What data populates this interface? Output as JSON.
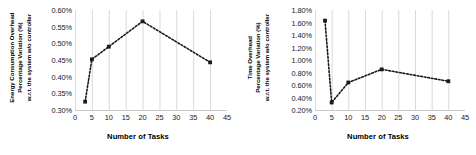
{
  "figure": {
    "panel_count": 2
  },
  "chart_data": [
    {
      "type": "line",
      "panel": "left",
      "title": "",
      "ylabel_lines": [
        "Energy Consumption Overhead",
        "Percentage Variation (%)",
        "w.r.t. the system w/o controller"
      ],
      "xlabel": "Number of Tasks",
      "x": [
        3,
        5,
        10,
        20,
        40
      ],
      "values": [
        0.325,
        0.452,
        0.49,
        0.566,
        0.443
      ],
      "xlim": [
        0,
        45
      ],
      "ylim": [
        0.3,
        0.6
      ],
      "xticks": [
        0,
        5,
        10,
        15,
        20,
        25,
        30,
        35,
        40,
        45
      ],
      "xticklabels": [
        "0",
        "5",
        "10",
        "15",
        "20",
        "25",
        "30",
        "35",
        "40",
        "45"
      ],
      "yticks": [
        0.3,
        0.35,
        0.4,
        0.45,
        0.5,
        0.55,
        0.6
      ],
      "yticklabels": [
        "0.30%",
        "0.35%",
        "0.40%",
        "0.45%",
        "0.50%",
        "0.55%",
        "0.60%"
      ],
      "grid": "vertical",
      "legend": "none",
      "marker": "square",
      "linestyle": "dotted",
      "color": "#1a1a1a"
    },
    {
      "type": "line",
      "panel": "right",
      "title": "",
      "ylabel_lines": [
        "Time Overhead",
        "Percentage Variation (%)",
        "w.r.t. the system w/o controller"
      ],
      "xlabel": "Number of Tasks",
      "x": [
        3,
        5,
        10,
        20,
        40
      ],
      "values": [
        1.63,
        0.32,
        0.64,
        0.85,
        0.66
      ],
      "xlim": [
        0,
        45
      ],
      "ylim": [
        0.2,
        1.8
      ],
      "xticks": [
        0,
        5,
        10,
        15,
        20,
        25,
        30,
        35,
        40,
        45
      ],
      "xticklabels": [
        "0",
        "5",
        "10",
        "15",
        "20",
        "25",
        "30",
        "35",
        "40",
        "45"
      ],
      "yticks": [
        0.2,
        0.4,
        0.6,
        0.8,
        1.0,
        1.2,
        1.4,
        1.6,
        1.8
      ],
      "yticklabels": [
        "0.20%",
        "0.40%",
        "0.60%",
        "0.80%",
        "1.00%",
        "1.20%",
        "1.40%",
        "1.60%",
        "1.80%"
      ],
      "grid": "vertical",
      "legend": "none",
      "marker": "square",
      "linestyle": "dotted",
      "color": "#1a1a1a"
    }
  ],
  "colors": {
    "series": "#1a1a1a",
    "gridline": "#d9d9d9",
    "axisline": "#c8c8c8",
    "text": "#000000",
    "background": "#ffffff"
  }
}
